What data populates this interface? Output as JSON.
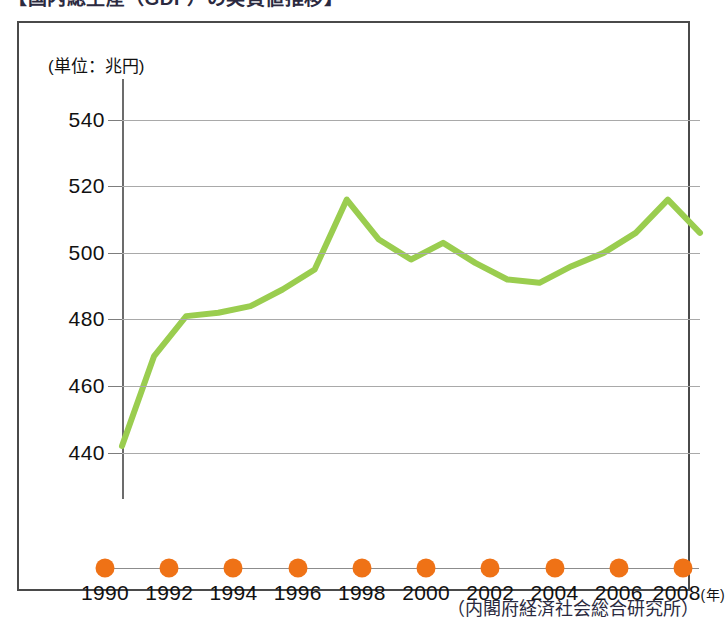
{
  "chart_title": "【国内総生産（GDP）の実質値推移】",
  "unit_label": "(単位：兆円)",
  "source_note": "（内閣府経済社会総合研究所）",
  "accent_colors": {
    "line": "#9acd4f",
    "marker": "#ef7216",
    "grid": "#a9a9a9",
    "frame": "#4a4a4a",
    "text": "#111111"
  },
  "chart_data": {
    "type": "line",
    "title": "【国内総生産（GDP）の実質値推移】",
    "subtitle": "(単位：兆円)",
    "xlabel": "(年)",
    "ylabel": "兆円",
    "ylim": [
      430,
      548
    ],
    "xlim": [
      1990,
      2008
    ],
    "grid": true,
    "legend": null,
    "yticks": [
      440,
      460,
      480,
      500,
      520,
      540
    ],
    "xticks": [
      1990,
      1992,
      1994,
      1996,
      1998,
      2000,
      2002,
      2004,
      2006,
      2008
    ],
    "x": [
      1990,
      1991,
      1992,
      1993,
      1994,
      1995,
      1996,
      1997,
      1998,
      1999,
      2000,
      2001,
      2002,
      2003,
      2004,
      2005,
      2006,
      2007,
      2008
    ],
    "series": [
      {
        "name": "実質GDP",
        "color": "#9acd4f",
        "values": [
          442,
          469,
          481,
          482,
          484,
          489,
          495,
          516,
          504,
          498,
          503,
          497,
          492,
          491,
          496,
          500,
          506,
          516,
          506
        ]
      }
    ],
    "annotations": [],
    "source": "（内閣府経済社会総合研究所）"
  },
  "axis": {
    "year_marker_icon": "circle-marker",
    "year_suffix": "(年)"
  }
}
